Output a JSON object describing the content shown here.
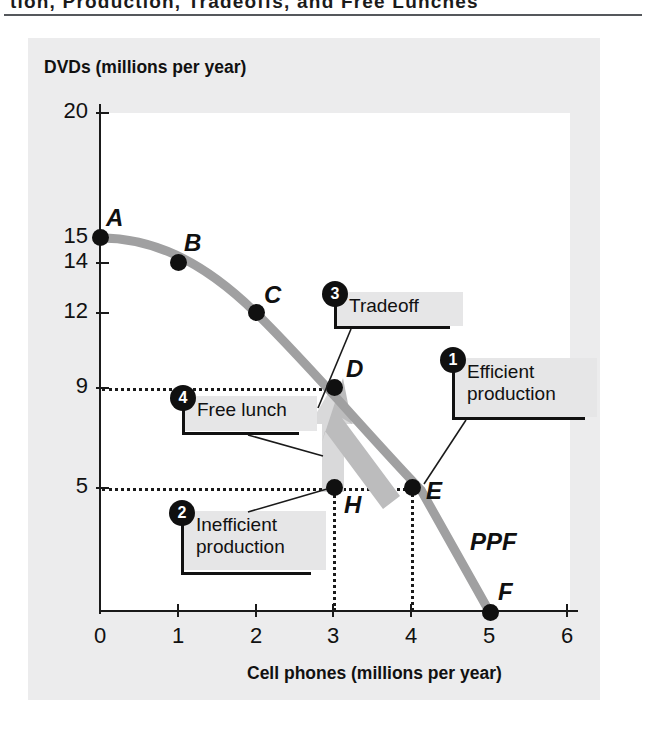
{
  "header": {
    "running_title": "tion, Production, Tradeoffs, and Free Lunches"
  },
  "figure": {
    "y_axis_title": "DVDs (millions per year)",
    "x_axis_title": "Cell phones (millions per year)",
    "curve_label": "PPF"
  },
  "chart_data": {
    "type": "line",
    "title": "",
    "xlabel": "Cell phones (millions per year)",
    "ylabel": "DVDs (millions per year)",
    "xlim": [
      0,
      6
    ],
    "ylim": [
      0,
      20
    ],
    "grid": false,
    "legend": "none",
    "x_ticks": [
      "0",
      "1",
      "2",
      "3",
      "4",
      "5",
      "6"
    ],
    "y_ticks": [
      "20",
      "15",
      "14",
      "12",
      "9",
      "5"
    ],
    "series": [
      {
        "name": "PPF",
        "x": [
          0,
          1,
          2,
          3,
          4,
          5
        ],
        "values": [
          15,
          14,
          12,
          9,
          5,
          0
        ],
        "point_labels": [
          "A",
          "B",
          "C",
          "D",
          "E",
          "F"
        ]
      },
      {
        "name": "Inefficient point",
        "x": [
          3
        ],
        "values": [
          5
        ],
        "point_labels": [
          "H"
        ]
      }
    ],
    "annotations": [
      {
        "id": "1",
        "text": "Efficient\nproduction",
        "target_point": "E"
      },
      {
        "id": "2",
        "text": "Inefficient\nproduction",
        "target_point": "H"
      },
      {
        "id": "3",
        "text": "Tradeoff",
        "target_point": "D-to-E arrow"
      },
      {
        "id": "4",
        "text": "Free lunch",
        "target_point": "H-to-D arrow"
      }
    ],
    "arrows": [
      {
        "name": "free-lunch-arrow",
        "from": "H",
        "to": "D",
        "direction": "up",
        "color": "#d7d7d8"
      },
      {
        "name": "tradeoff-arrow",
        "from": "D",
        "to": "E",
        "direction": "down-right",
        "color": "#b5b5b6"
      }
    ]
  },
  "points": [
    {
      "label": "A",
      "x": 0,
      "y": 15
    },
    {
      "label": "B",
      "x": 1,
      "y": 14
    },
    {
      "label": "C",
      "x": 2,
      "y": 12
    },
    {
      "label": "D",
      "x": 3,
      "y": 9
    },
    {
      "label": "E",
      "x": 4,
      "y": 5
    },
    {
      "label": "F",
      "x": 5,
      "y": 0
    },
    {
      "label": "H",
      "x": 3,
      "y": 5
    }
  ],
  "callouts": {
    "efficient": {
      "number": "1",
      "text": "Efficient\nproduction"
    },
    "inefficient": {
      "number": "2",
      "text": "Inefficient\nproduction"
    },
    "tradeoff": {
      "number": "3",
      "text": "Tradeoff"
    },
    "free_lunch": {
      "number": "4",
      "text": "Free lunch"
    }
  },
  "y_ticks": [
    {
      "value": "20",
      "pos": 113
    },
    {
      "value": "15",
      "pos": 238
    },
    {
      "value": "14",
      "pos": 263
    },
    {
      "value": "12",
      "pos": 313
    },
    {
      "value": "9",
      "pos": 388
    },
    {
      "value": "5",
      "pos": 488
    }
  ],
  "x_ticks": [
    {
      "value": "0",
      "pos": 100
    },
    {
      "value": "1",
      "pos": 178
    },
    {
      "value": "2",
      "pos": 256
    },
    {
      "value": "3",
      "pos": 333
    },
    {
      "value": "4",
      "pos": 411
    },
    {
      "value": "5",
      "pos": 489
    },
    {
      "value": "6",
      "pos": 567
    }
  ],
  "colors": {
    "curve": "#a0a0a1",
    "point": "#101010",
    "panel_bg": "#ececed",
    "callout_bg": "#e6e6e7",
    "arrow_light": "#d9d9da",
    "arrow_mid": "#b8b8b9"
  }
}
